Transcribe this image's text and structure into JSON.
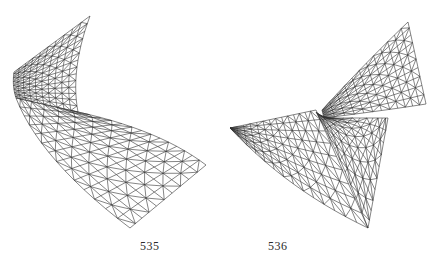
{
  "figures": [
    {
      "number": "535",
      "description": "Wireframe triangulated mesh of a twisted flaring surface (horn/trumpet-like saddle)"
    },
    {
      "number": "536",
      "description": "Wireframe triangulated mesh of a self-intersecting twisted surface with two lobes"
    }
  ],
  "colors": {
    "background": "#ffffff",
    "ink": "#333333"
  }
}
